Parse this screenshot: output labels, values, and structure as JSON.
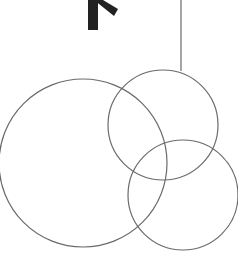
{
  "diagram": {
    "background": "#ffffff",
    "stroke_color": "#6a6a6a",
    "arrow_color": "#222222",
    "circles": [
      {
        "name": "large-left-circle",
        "cx": 83,
        "cy": 163,
        "r": 84
      },
      {
        "name": "upper-right-circle",
        "cx": 163,
        "cy": 125,
        "r": 55
      },
      {
        "name": "lower-right-circle",
        "cx": 183,
        "cy": 195,
        "r": 55
      }
    ],
    "connector_line": {
      "x1": 181,
      "y1": 0,
      "x2": 181,
      "y2": 71
    },
    "arrow_mark": {
      "description": "thick black arrow-like chevron fragment at top"
    }
  }
}
